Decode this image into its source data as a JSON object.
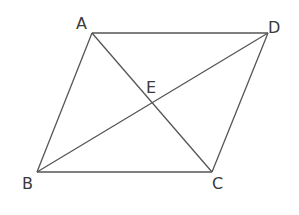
{
  "diagram": {
    "type": "parallelogram with diagonals",
    "stroke_color": "#555555",
    "label_color": "#3a3a3a",
    "points": {
      "A": {
        "label": "A",
        "x": 92,
        "y": 33
      },
      "D": {
        "label": "D",
        "x": 268,
        "y": 33
      },
      "B": {
        "label": "B",
        "x": 37,
        "y": 172
      },
      "C": {
        "label": "C",
        "x": 212,
        "y": 172
      },
      "E": {
        "label": "E",
        "x": 150,
        "y": 102
      }
    },
    "segments": [
      [
        "A",
        "D"
      ],
      [
        "D",
        "C"
      ],
      [
        "C",
        "B"
      ],
      [
        "B",
        "A"
      ],
      [
        "A",
        "C"
      ],
      [
        "B",
        "D"
      ]
    ]
  }
}
